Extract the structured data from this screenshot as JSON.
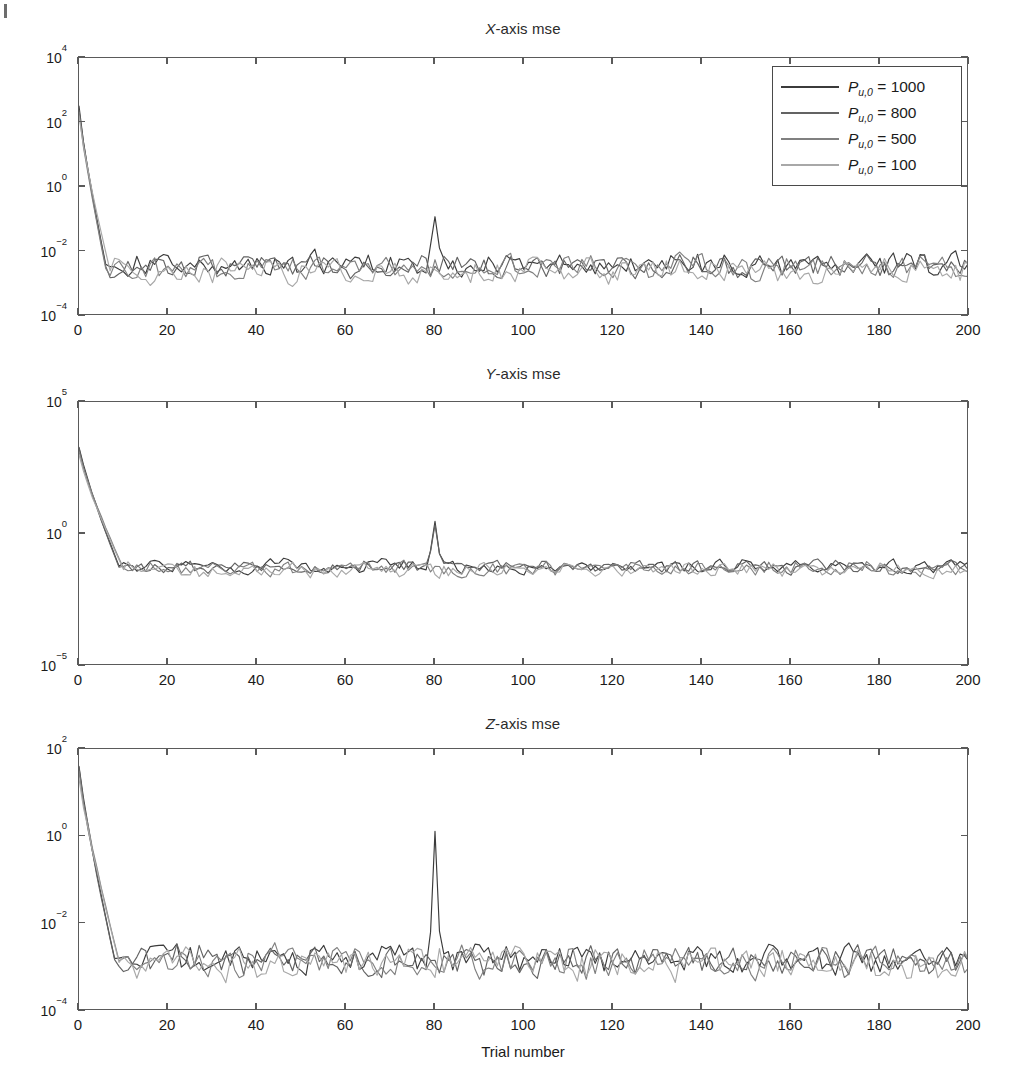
{
  "figure": {
    "xlabel": "Trial number",
    "panels": [
      {
        "title_prefix": "X",
        "title_suffix": "-axis mse",
        "ylabels": [
          "10",
          "10",
          "10",
          "10",
          "10"
        ],
        "yexponents": [
          "4",
          "2",
          "0",
          "−2",
          "−4"
        ],
        "ylim_log": [
          -4,
          4
        ],
        "yticks_log": [
          4,
          2,
          0,
          -2,
          -4
        ]
      },
      {
        "title_prefix": "Y",
        "title_suffix": "-axis mse",
        "ylabels": [
          "10",
          "10",
          "10"
        ],
        "yexponents": [
          "5",
          "0",
          "−5"
        ],
        "ylim_log": [
          -5,
          5
        ],
        "yticks_log": [
          5,
          0,
          -5
        ]
      },
      {
        "title_prefix": "Z",
        "title_suffix": "-axis mse",
        "ylabels": [
          "10",
          "10",
          "10",
          "10"
        ],
        "yexponents": [
          "2",
          "0",
          "−2",
          "−4"
        ],
        "ylim_log": [
          -4,
          2
        ],
        "yticks_log": [
          2,
          0,
          -2,
          -4
        ]
      }
    ],
    "xticks": [
      0,
      20,
      40,
      60,
      80,
      100,
      120,
      140,
      160,
      180,
      200
    ],
    "xlim": [
      0,
      200
    ]
  },
  "legend": {
    "position": "top-right-panel-1",
    "entries": [
      {
        "symbol": "P",
        "sub": "u,0",
        "eq": " = ",
        "value": "1000",
        "color": "#3b3b3b"
      },
      {
        "symbol": "P",
        "sub": "u,0",
        "eq": " = ",
        "value": "800",
        "color": "#636363"
      },
      {
        "symbol": "P",
        "sub": "u,0",
        "eq": " = ",
        "value": "500",
        "color": "#808080"
      },
      {
        "symbol": "P",
        "sub": "u,0",
        "eq": " = ",
        "value": "100",
        "color": "#a8a8a8"
      }
    ]
  },
  "chart_data": {
    "type": "line",
    "xlabel": "Trial number",
    "ylabel": "mse",
    "yscale": "log",
    "grid": false,
    "legend_position": "upper right of first subplot",
    "x": [
      0,
      200
    ],
    "x_step": 1,
    "subplots": [
      {
        "title": "X-axis mse",
        "ylim": [
          0.0001,
          10000.0
        ],
        "ytick_values": [
          10000.0,
          100.0,
          1.0,
          0.01,
          0.0001
        ],
        "xlim": [
          0,
          200
        ],
        "xtick_values": [
          0,
          20,
          40,
          60,
          80,
          100,
          120,
          140,
          160,
          180,
          200
        ],
        "description": "All four traces start near 3e2 at trial 0, fall steeply over the first ~6 trials, then fluctuate in a noise floor around 2e-3 to 1e-2 for the remainder. A transient spike to about 1.2e-1 occurs at trial 80 on the darkest trace.",
        "series": [
          {
            "name": "P_u,0 = 1000",
            "color": "#3b3b3b",
            "start": 300,
            "floor": 0.004,
            "settle_trial": 6,
            "spike_trial": 80,
            "spike_value": 0.12,
            "noise_decades": 0.42
          },
          {
            "name": "P_u,0 = 800",
            "color": "#636363",
            "start": 260,
            "floor": 0.0035,
            "settle_trial": 6,
            "spike_trial": null,
            "spike_value": null,
            "noise_decades": 0.44
          },
          {
            "name": "P_u,0 = 500",
            "color": "#808080",
            "start": 210,
            "floor": 0.003,
            "settle_trial": 6,
            "spike_trial": null,
            "spike_value": null,
            "noise_decades": 0.46
          },
          {
            "name": "P_u,0 = 100",
            "color": "#a8a8a8",
            "start": 150,
            "floor": 0.0025,
            "settle_trial": 7,
            "spike_trial": null,
            "spike_value": null,
            "noise_decades": 0.48
          }
        ]
      },
      {
        "title": "Y-axis mse",
        "ylim": [
          1e-05,
          100000.0
        ],
        "ytick_values": [
          100000.0,
          1.0,
          1e-05
        ],
        "xlim": [
          0,
          200
        ],
        "xtick_values": [
          0,
          20,
          40,
          60,
          80,
          100,
          120,
          140,
          160,
          180,
          200
        ],
        "description": "Traces begin near 2e3 at trial 0 and decay to a noise floor near 6e-2 by trial 10, staying roughly flat thereafter. A pronounced narrow spike reaching about 3 appears at trial 80.",
        "series": [
          {
            "name": "P_u,0 = 1000",
            "color": "#3b3b3b",
            "start": 2000,
            "floor": 0.06,
            "settle_trial": 9,
            "spike_trial": 80,
            "spike_value": 3.0,
            "noise_decades": 0.3
          },
          {
            "name": "P_u,0 = 800",
            "color": "#636363",
            "start": 1700,
            "floor": 0.055,
            "settle_trial": 9,
            "spike_trial": 80,
            "spike_value": 2.2,
            "noise_decades": 0.31
          },
          {
            "name": "P_u,0 = 500",
            "color": "#808080",
            "start": 1300,
            "floor": 0.05,
            "settle_trial": 10,
            "spike_trial": null,
            "spike_value": null,
            "noise_decades": 0.32
          },
          {
            "name": "P_u,0 = 100",
            "color": "#a8a8a8",
            "start": 900,
            "floor": 0.045,
            "settle_trial": 10,
            "spike_trial": null,
            "spike_value": null,
            "noise_decades": 0.33
          }
        ]
      },
      {
        "title": "Z-axis mse",
        "ylim": [
          0.0001,
          100.0
        ],
        "ytick_values": [
          100.0,
          1.0,
          0.01,
          0.0001
        ],
        "xlim": [
          0,
          200
        ],
        "xtick_values": [
          0,
          20,
          40,
          60,
          80,
          100,
          120,
          140,
          160,
          180,
          200
        ],
        "description": "Traces start near 4e1 at trial 0, decay steeply through trial 8, and then oscillate around a noise floor of roughly 1.5e-3. A very tall narrow spike rises to about 1.3 at trial 80; smaller local peaks occur near trials 27, 128 and 163.",
        "series": [
          {
            "name": "P_u,0 = 1000",
            "color": "#3b3b3b",
            "start": 40,
            "floor": 0.0016,
            "settle_trial": 8,
            "spike_trial": 80,
            "spike_value": 1.3,
            "noise_decades": 0.4
          },
          {
            "name": "P_u,0 = 800",
            "color": "#636363",
            "start": 34,
            "floor": 0.0015,
            "settle_trial": 8,
            "spike_trial": null,
            "spike_value": null,
            "noise_decades": 0.42
          },
          {
            "name": "P_u,0 = 500",
            "color": "#808080",
            "start": 28,
            "floor": 0.0014,
            "settle_trial": 9,
            "spike_trial": null,
            "spike_value": null,
            "noise_decades": 0.44
          },
          {
            "name": "P_u,0 = 100",
            "color": "#a8a8a8",
            "start": 22,
            "floor": 0.0013,
            "settle_trial": 9,
            "spike_trial": null,
            "spike_value": null,
            "noise_decades": 0.46
          }
        ]
      }
    ]
  }
}
